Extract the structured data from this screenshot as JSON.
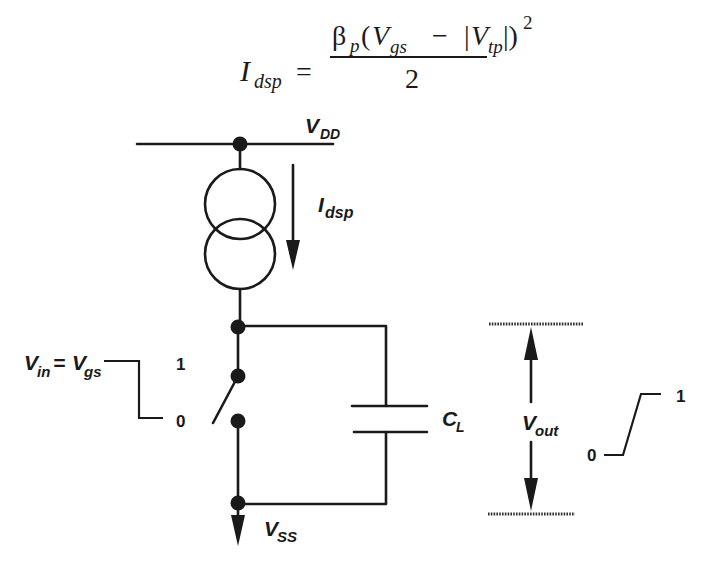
{
  "equation": {
    "lhs_symbol": "I",
    "lhs_sub": "dsp",
    "equals": "=",
    "beta": "β",
    "beta_sub": "p",
    "open_paren": "(",
    "vgs_symbol": "V",
    "vgs_sub": "gs",
    "minus": "−",
    "abs_open": "|",
    "vtp_symbol": "V",
    "vtp_sub": "tp",
    "abs_close": "|)",
    "exponent": "2",
    "denominator": "2"
  },
  "circuit": {
    "vdd_label": "V",
    "vdd_sub": "DD",
    "current_label": "I",
    "current_sub": "dsp",
    "vss_label": "V",
    "vss_sub": "SS",
    "cap_label": "C",
    "cap_sub": "L",
    "vout_label": "V",
    "vout_sub": "out"
  },
  "input_waveform": {
    "label_v": "V",
    "label_in_sub": "in",
    "label_eq": "=",
    "label_v2": "V",
    "label_gs_sub": "gs",
    "high": "1",
    "low": "0"
  },
  "output_waveform": {
    "low": "0",
    "high": "1"
  },
  "colors": {
    "ink": "#1a1a1a",
    "background": "#ffffff"
  }
}
